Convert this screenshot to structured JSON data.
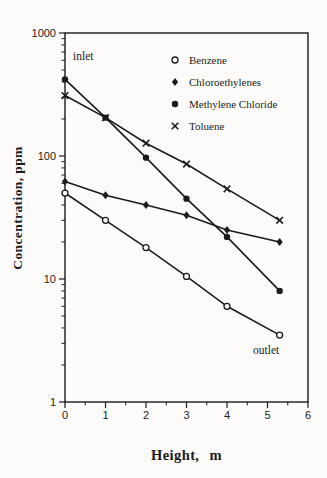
{
  "figure": {
    "background": "#fcfbf9",
    "ink": "#1b1b1b"
  },
  "chart_data": {
    "type": "line",
    "title": "",
    "xlabel": "Height, m",
    "ylabel": "Concentration, ppm",
    "x_scale": "linear",
    "y_scale": "log",
    "xlim": [
      0,
      6
    ],
    "ylim": [
      1,
      1000
    ],
    "x_ticks": [
      0,
      1,
      2,
      3,
      4,
      5,
      6
    ],
    "x_minor_step": 0.5,
    "y_ticks": [
      1,
      10,
      100,
      1000
    ],
    "y_tick_labels": [
      "1",
      "10",
      "100",
      "1000"
    ],
    "grid": false,
    "legend_position": "upper-right-inside",
    "x": [
      0,
      1,
      2,
      3,
      4,
      5.3
    ],
    "series": [
      {
        "name": "Benzene",
        "marker": "open-circle",
        "values": [
          50,
          30,
          18,
          10.5,
          6,
          3.5
        ]
      },
      {
        "name": "Chloroethylenes",
        "marker": "filled-diamond",
        "values": [
          62,
          48,
          40,
          33,
          25,
          20
        ]
      },
      {
        "name": "Methylene Chloride",
        "marker": "filled-circle",
        "values": [
          420,
          205,
          97,
          45,
          22,
          8
        ]
      },
      {
        "name": "Toluene",
        "marker": "x-cross",
        "values": [
          310,
          205,
          127,
          86,
          54,
          30
        ]
      }
    ],
    "annotations": [
      {
        "text": "inlet",
        "x": 0.2,
        "y": 640
      },
      {
        "text": "outlet",
        "x": 4.65,
        "y": 2.6
      }
    ]
  }
}
